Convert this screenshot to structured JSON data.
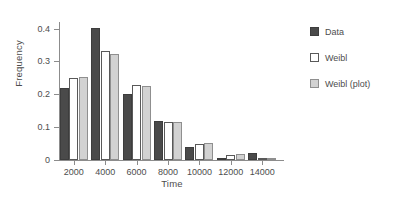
{
  "chart_data": {
    "type": "bar",
    "title": "",
    "xlabel": "Time",
    "ylabel": "Frequency",
    "categories": [
      "2000",
      "4000",
      "6000",
      "8000",
      "10000",
      "12000",
      "14000"
    ],
    "series": [
      {
        "name": "Data",
        "color": "#4a4a4a",
        "values": [
          0.22,
          0.402,
          0.202,
          0.119,
          0.04,
          0.001,
          0.02
        ]
      },
      {
        "name": "Weibl",
        "color": "#ffffff",
        "values": [
          0.25,
          0.332,
          0.229,
          0.116,
          0.049,
          0.014,
          0.005
        ]
      },
      {
        "name": "Weibl (plot)",
        "color": "#d2d2d2",
        "values": [
          0.254,
          0.323,
          0.224,
          0.116,
          0.053,
          0.018,
          0.007
        ]
      }
    ],
    "ylim": [
      0,
      0.42
    ],
    "yticks": [
      0,
      0.1,
      0.2,
      0.3,
      0.4
    ],
    "ytick_labels": [
      "0",
      "0.1",
      "0.2",
      "0.3",
      "0.4"
    ],
    "grid": false,
    "legend_position": "right"
  },
  "legend": {
    "items": [
      {
        "label": "Data"
      },
      {
        "label": "Weibl"
      },
      {
        "label": "Weibl (plot)"
      }
    ]
  }
}
